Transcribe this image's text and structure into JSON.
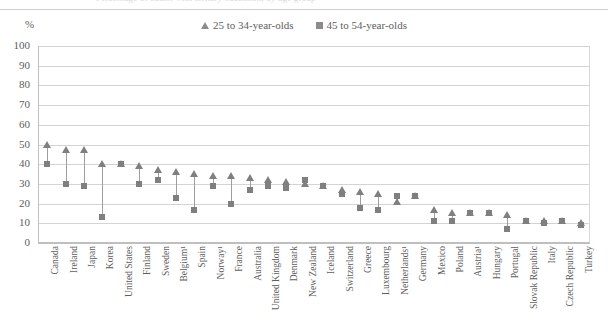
{
  "top_strip": {
    "clipped_text": "Percentage of adults with tertiary education, by age group"
  },
  "unit": "%",
  "legend": [
    {
      "marker": "triangle-marker",
      "label": "25 to 34-year-olds",
      "color": "#7f7f7f"
    },
    {
      "marker": "square-marker",
      "label": "45 to 54-year-olds",
      "color": "#7f7f7f"
    }
  ],
  "chart_data": {
    "type": "scatter",
    "title": "",
    "subtitle": "",
    "xlabel": "",
    "ylabel": "%",
    "ylim": [
      0,
      100
    ],
    "yticks": [
      0,
      10,
      20,
      30,
      40,
      50,
      60,
      70,
      80,
      90,
      100
    ],
    "grid": true,
    "legend_position": "top-center",
    "categories": [
      "Canada",
      "Ireland",
      "Japan",
      "Korea",
      "United States",
      "Finland",
      "Sweden",
      "Belgium¹",
      "Spain",
      "Norway¹",
      "France",
      "Australia",
      "United Kingdom",
      "Denmark",
      "New Zealand",
      "Iceland",
      "Switzerland",
      "Greece",
      "Luxembourg",
      "Netherlands¹",
      "Germany",
      "Mexico",
      "Poland",
      "Austria¹",
      "Hungary",
      "Portugal",
      "Slovak Republic",
      "Italy",
      "Czech Republic",
      "Turkey"
    ],
    "series": [
      {
        "name": "25 to 34-year-olds",
        "marker": "triangle",
        "color": "#7f7f7f",
        "values": [
          50,
          47,
          47,
          40,
          40,
          39,
          37,
          36,
          35,
          34,
          34,
          33,
          32,
          31,
          30,
          29,
          27,
          26,
          25,
          21,
          24,
          17,
          15,
          15,
          15,
          14,
          11,
          11,
          11,
          10
        ]
      },
      {
        "name": "45 to 54-year-olds",
        "marker": "square",
        "color": "#7f7f7f",
        "values": [
          40,
          30,
          29,
          13,
          40,
          30,
          32,
          23,
          17,
          29,
          20,
          27,
          29,
          28,
          32,
          29,
          25,
          18,
          17,
          24,
          24,
          11,
          11,
          15,
          15,
          7,
          11,
          10,
          11,
          9
        ]
      }
    ]
  }
}
